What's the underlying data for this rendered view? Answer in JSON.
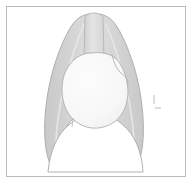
{
  "figure": {
    "title": "Chest radiograph schematic (PA view)",
    "type": "anatomical-diagram",
    "canvas": {
      "width": 193,
      "height": 191
    },
    "frame": {
      "x": 6,
      "y": 6,
      "width": 180,
      "height": 171,
      "border_color": "#b9b9b9",
      "background_color": "#ffffff"
    },
    "palette": {
      "background": "#ffffff",
      "lung_fill": "#d2d2d2",
      "lung_stroke": "#a8a8a8",
      "lung_inner_highlight": "#e2e2e2",
      "heart_fill": "#f8f8f8",
      "heart_stroke": "#b0b0b0",
      "trachea_fill": "#dcdcdc",
      "trachea_stroke": "#b5b5b5",
      "diaphragm_stroke": "#a8a8a8",
      "faint_mark": "#dddddd"
    },
    "parts": [
      {
        "name": "right-lung-field",
        "label": "Right lung field",
        "fill": "#d2d2d2",
        "stroke": "#a8a8a8",
        "path": "M 89 14 C 80 15, 74 21, 69 30 C 60 46, 52 69, 48 92 C 45 110, 44 126, 45 140 C 46 154, 49 163, 53 170 C 55 173, 58 172, 58 168 C 58 156, 60 144, 63 135 C 67 124, 73 117, 81 113 C 86 110, 90 108, 93 106 L 93 60 C 92 50, 92 38, 92 28 C 92 20, 92 15, 89 14 Z"
      },
      {
        "name": "left-lung-field",
        "label": "Left lung field",
        "fill": "#d2d2d2",
        "stroke": "#a8a8a8",
        "path": "M 99 14 C 108 15, 114 21, 119 30 C 128 46, 136 69, 140 92 C 143 110, 144 126, 143 140 C 142 154, 139 163, 135 170 C 133 173, 130 172, 130 168 C 130 156, 128 144, 125 135 C 121 124, 115 117, 107 113 C 102 110, 98 108, 95 106 L 95 60 C 96 50, 96 38, 96 28 C 96 20, 96 15, 99 14 Z"
      },
      {
        "name": "trachea",
        "label": "Trachea / mediastinal column",
        "fill": "#dcdcdc",
        "stroke": "#b5b5b5",
        "path": "M 85 17 C 86 15, 90 13, 94 13 C 98 13, 102 15, 103 17 L 104 58 C 104 62, 101 64, 94 64 C 87 64, 84 62, 84 58 Z"
      },
      {
        "name": "heart-silhouette",
        "label": "Cardiac silhouette",
        "fill": "#f8f8f8",
        "stroke": "#b0b0b0",
        "path": "M 91 53 C 83 53, 76 57, 71 63 C 65 70, 62 79, 62 89 C 62 100, 65 110, 71 117 C 78 125, 88 129, 98 128 C 109 127, 118 121, 123 112 C 128 103, 129 92, 127 82 C 125 72, 121 63, 115 58 C 109 53, 100 52, 91 53 Z"
      },
      {
        "name": "heart-left-border-curve",
        "label": "Left heart border (pulmonary artery segment)",
        "stroke": "#b0b0b0",
        "fill": "none",
        "path": "M 112 55 C 114 63, 117 70, 122 74 C 126 77, 128 80, 128 85"
      },
      {
        "name": "diaphragm-dome",
        "label": "Diaphragm",
        "stroke": "#a8a8a8",
        "fill": "#ffffff",
        "path": "M 48 172 C 50 150, 58 133, 70 124 C 80 116, 90 113, 97 113 C 105 113, 114 117, 123 125 C 135 135, 142 152, 143 172 Z"
      },
      {
        "name": "right-costophrenic-angle",
        "label": "Right costophrenic angle",
        "stroke": "#a8a8a8"
      },
      {
        "name": "left-costophrenic-angle",
        "label": "Left costophrenic angle",
        "stroke": "#a8a8a8"
      },
      {
        "name": "faint-mark-upper",
        "label": "Faint annotation mark",
        "x": 153,
        "y": 95,
        "width": 2,
        "height": 9,
        "color": "#dddddd"
      },
      {
        "name": "faint-mark-lower",
        "label": "Faint annotation mark",
        "x": 155,
        "y": 107,
        "width": 6,
        "height": 2,
        "color": "#dddddd"
      }
    ]
  }
}
